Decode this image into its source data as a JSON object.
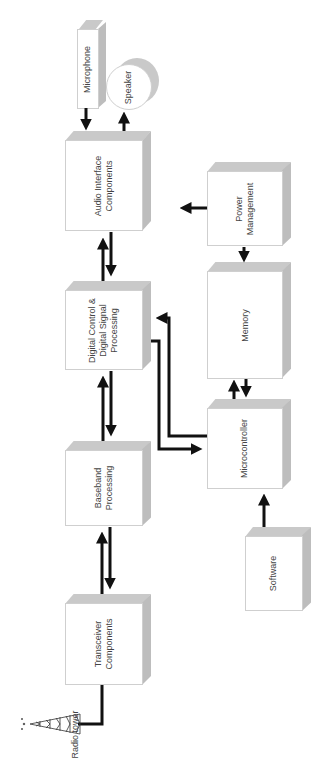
{
  "diagram": {
    "orientation": "rotated-90",
    "blocks": {
      "microphone": {
        "label": "Microphone"
      },
      "speaker": {
        "label": "Speaker"
      },
      "audio_interface": {
        "label": "Audio Interface\nComponents"
      },
      "digital_control": {
        "label": "Digital Control &\nDigital Signal\nProcessing"
      },
      "baseband": {
        "label": "Baseband\nProcessing"
      },
      "transceiver": {
        "label": "Transceiver\nComponents"
      },
      "power_management": {
        "label": "Power\nManagement"
      },
      "memory": {
        "label": "Memory"
      },
      "microcontroller": {
        "label": "Microcontroller"
      },
      "software": {
        "label": "Software"
      },
      "radio_tower": {
        "label": "Radio tower"
      }
    },
    "connections": [
      {
        "from": "microphone",
        "to": "audio_interface"
      },
      {
        "from": "audio_interface",
        "to": "speaker"
      },
      {
        "from": "power_management",
        "to": "audio_interface"
      },
      {
        "from": "power_management",
        "to": "memory"
      },
      {
        "from": "audio_interface",
        "to": "digital_control",
        "bidirectional": true
      },
      {
        "from": "digital_control",
        "to": "baseband",
        "bidirectional": true
      },
      {
        "from": "baseband",
        "to": "transceiver",
        "bidirectional": true
      },
      {
        "from": "memory",
        "to": "microcontroller",
        "bidirectional": true
      },
      {
        "from": "microcontroller",
        "to": "digital_control"
      },
      {
        "from": "digital_control",
        "to": "microcontroller"
      },
      {
        "from": "software",
        "to": "microcontroller"
      },
      {
        "from": "transceiver",
        "to": "radio_tower"
      }
    ],
    "colors": {
      "face": "#ffffff",
      "shade": "#c4c4c4",
      "arrow": "#111111",
      "text": "#444444"
    }
  }
}
